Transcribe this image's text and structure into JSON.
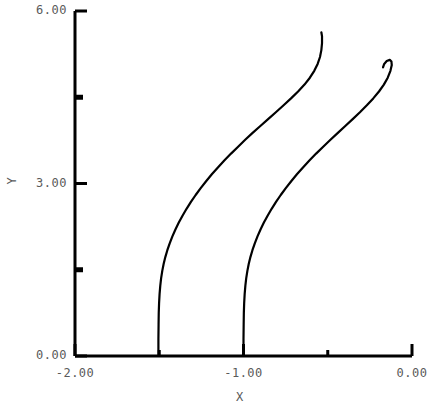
{
  "chart_data": {
    "type": "line",
    "title": "",
    "subtitle": "",
    "xlabel": "X",
    "ylabel": "Y",
    "xlim": [
      -2.0,
      0.0
    ],
    "ylim": [
      0.0,
      6.0
    ],
    "grid": false,
    "legend": "none",
    "x_ticks": [
      -2.0,
      -1.5,
      -1.0,
      -0.5,
      0.0
    ],
    "x_tick_labels": [
      "-2.00",
      "",
      "-1.00",
      "",
      "0.00"
    ],
    "y_ticks": [
      0.0,
      1.5,
      3.0,
      4.5,
      6.0
    ],
    "y_tick_labels": [
      "0.00",
      "",
      "3.00",
      "",
      "6.00"
    ],
    "line_color": "#000000",
    "line_width": 2.2,
    "axis_color": "#000000",
    "background_color": "#ffffff",
    "series": [
      {
        "name": "curve-1",
        "points": [
          [
            -1.505,
            0.0
          ],
          [
            -1.505,
            0.3
          ],
          [
            -1.504,
            0.55
          ],
          [
            -1.503,
            0.75
          ],
          [
            -1.501,
            0.92
          ],
          [
            -1.498,
            1.08
          ],
          [
            -1.494,
            1.22
          ],
          [
            -1.489,
            1.35
          ],
          [
            -1.482,
            1.48
          ],
          [
            -1.474,
            1.6
          ],
          [
            -1.464,
            1.72
          ],
          [
            -1.452,
            1.84
          ],
          [
            -1.438,
            1.96
          ],
          [
            -1.422,
            2.08
          ],
          [
            -1.404,
            2.2
          ],
          [
            -1.384,
            2.32
          ],
          [
            -1.362,
            2.44
          ],
          [
            -1.338,
            2.56
          ],
          [
            -1.312,
            2.68
          ],
          [
            -1.284,
            2.8
          ],
          [
            -1.254,
            2.92
          ],
          [
            -1.222,
            3.04
          ],
          [
            -1.188,
            3.16
          ],
          [
            -1.152,
            3.28
          ],
          [
            -1.114,
            3.4
          ],
          [
            -1.074,
            3.52
          ],
          [
            -1.032,
            3.64
          ],
          [
            -0.99,
            3.76
          ],
          [
            -0.946,
            3.88
          ],
          [
            -0.9,
            4.0
          ],
          [
            -0.854,
            4.12
          ],
          [
            -0.808,
            4.24
          ],
          [
            -0.762,
            4.36
          ],
          [
            -0.718,
            4.48
          ],
          [
            -0.676,
            4.6
          ],
          [
            -0.638,
            4.72
          ],
          [
            -0.606,
            4.84
          ],
          [
            -0.58,
            4.96
          ],
          [
            -0.56,
            5.08
          ],
          [
            -0.546,
            5.2
          ],
          [
            -0.538,
            5.32
          ],
          [
            -0.534,
            5.44
          ],
          [
            -0.534,
            5.56
          ],
          [
            -0.538,
            5.63
          ]
        ]
      },
      {
        "name": "curve-2",
        "points": [
          [
            -1.0,
            0.0
          ],
          [
            -1.0,
            0.3
          ],
          [
            -0.999,
            0.55
          ],
          [
            -0.998,
            0.75
          ],
          [
            -0.996,
            0.92
          ],
          [
            -0.993,
            1.08
          ],
          [
            -0.989,
            1.22
          ],
          [
            -0.984,
            1.35
          ],
          [
            -0.977,
            1.48
          ],
          [
            -0.969,
            1.6
          ],
          [
            -0.959,
            1.72
          ],
          [
            -0.947,
            1.84
          ],
          [
            -0.933,
            1.96
          ],
          [
            -0.917,
            2.08
          ],
          [
            -0.899,
            2.2
          ],
          [
            -0.879,
            2.32
          ],
          [
            -0.857,
            2.44
          ],
          [
            -0.833,
            2.56
          ],
          [
            -0.807,
            2.68
          ],
          [
            -0.779,
            2.8
          ],
          [
            -0.749,
            2.92
          ],
          [
            -0.717,
            3.04
          ],
          [
            -0.683,
            3.16
          ],
          [
            -0.647,
            3.28
          ],
          [
            -0.609,
            3.4
          ],
          [
            -0.569,
            3.52
          ],
          [
            -0.527,
            3.64
          ],
          [
            -0.484,
            3.76
          ],
          [
            -0.44,
            3.88
          ],
          [
            -0.396,
            4.0
          ],
          [
            -0.352,
            4.12
          ],
          [
            -0.309,
            4.24
          ],
          [
            -0.268,
            4.36
          ],
          [
            -0.23,
            4.48
          ],
          [
            -0.196,
            4.6
          ],
          [
            -0.167,
            4.72
          ],
          [
            -0.144,
            4.84
          ],
          [
            -0.128,
            4.96
          ],
          [
            -0.12,
            5.06
          ],
          [
            -0.122,
            5.12
          ],
          [
            -0.132,
            5.15
          ],
          [
            -0.15,
            5.13
          ],
          [
            -0.165,
            5.08
          ],
          [
            -0.172,
            5.02
          ]
        ]
      }
    ]
  }
}
